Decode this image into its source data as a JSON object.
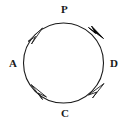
{
  "figure": {
    "type": "circular-arrow-diagram",
    "background_color": "#ffffff",
    "stroke_color": "#1a1a1a",
    "filled_arrow_color": "#000000",
    "hollow_arrow_fill": "#ffffff"
  },
  "circle": {
    "center_x": 63.5,
    "center_y": 63,
    "radius": 40,
    "stroke_width": 1.1
  },
  "labels": {
    "top": "P",
    "left": "A",
    "right": "D",
    "bottom": "C"
  },
  "arrowheads": [
    {
      "id": "arrow-top-right",
      "style": "filled",
      "angle_deg": 42,
      "direction": "clockwise",
      "fill": "#000000"
    },
    {
      "id": "arrow-top-left",
      "style": "hollow",
      "angle_deg": 137,
      "direction": "clockwise",
      "fill": "#ffffff"
    },
    {
      "id": "arrow-bottom-left",
      "style": "hollow",
      "angle_deg": 217,
      "direction": "clockwise",
      "fill": "#ffffff"
    },
    {
      "id": "arrow-bottom-right",
      "style": "hollow",
      "angle_deg": 318,
      "direction": "clockwise",
      "fill": "#ffffff"
    }
  ]
}
